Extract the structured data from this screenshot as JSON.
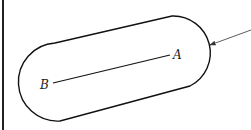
{
  "diagram": {
    "labels": {
      "point_a": "A",
      "point_b": "B"
    },
    "colors": {
      "stroke": "#111111",
      "arrow": "#333333",
      "background": "#ffffff"
    }
  }
}
